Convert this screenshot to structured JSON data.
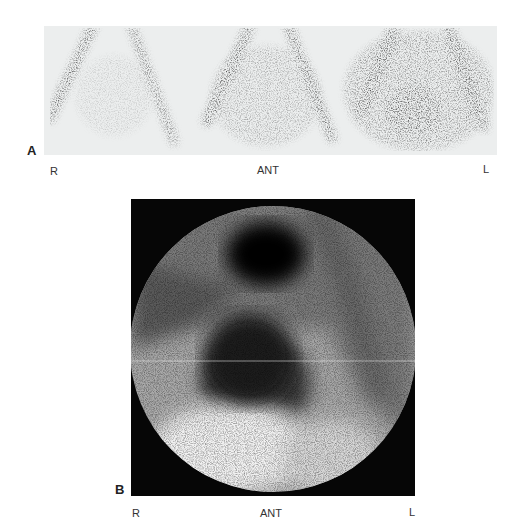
{
  "figure": {
    "panel_a": {
      "label": "A",
      "orientation": {
        "right": "R",
        "view": "ANT",
        "left": "L"
      },
      "description": "Three sequential anterior scintigraphy frames showing V-shaped iliac vessel activity with progressive central uptake"
    },
    "panel_b": {
      "label": "B",
      "orientation": {
        "right": "R",
        "view": "ANT",
        "left": "L"
      },
      "description": "Circular gamma camera anterior image with dense upper focal uptake and lower rounded central uptake"
    },
    "colors": {
      "strip_bg": "#eceeee",
      "panel_b_bg": "#060606",
      "activity": "#1a1a1a"
    }
  }
}
